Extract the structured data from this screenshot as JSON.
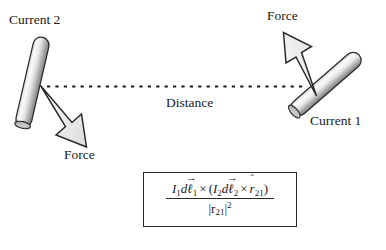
{
  "figure": {
    "type": "physics-force-diagram",
    "title_visible": false,
    "background_color": "#ffffff",
    "ink_color": "#1a1a1a"
  },
  "labels": {
    "current_2": "Current 2",
    "current_1": "Current 1",
    "distance": "Distance",
    "force_left": "Force",
    "force_right": "Force"
  },
  "elements": {
    "rod_left": {
      "name": "Current 2",
      "description": "shaded cylindrical current-carrying rod, tilted",
      "fill_light": "#f2f2f2",
      "fill_dark": "#8e8e8e"
    },
    "rod_right": {
      "name": "Current 1",
      "description": "shaded cylindrical current-carrying rod, tilted",
      "fill_light": "#f5f5f5",
      "fill_dark": "#8a8a8a"
    },
    "distance_line": {
      "style": "dashed",
      "color": "#1a1a1a"
    },
    "arrow_left": {
      "label": "Force",
      "direction": "down-right",
      "fill": "#eaeaea"
    },
    "arrow_right": {
      "label": "Force",
      "direction": "up-left",
      "fill": "#f0f0f0"
    }
  },
  "formula": {
    "numerator": {
      "term1_current": "I",
      "term1_current_sub": "1",
      "term1_d": "d",
      "term1_length": "ℓ",
      "term1_length_sub": "1",
      "cross1": "×",
      "open_paren": "(",
      "term2_current": "I",
      "term2_current_sub": "2",
      "term2_d": "d",
      "term2_length": "ℓ",
      "term2_length_sub": "2",
      "cross2": "×",
      "unit_vector": "r",
      "unit_vector_sub": "21",
      "close_paren": ")",
      "plain": "I1dℓ⃗1 × (I2dℓ⃗2 × r̂21)"
    },
    "denominator": {
      "bar_left": "|",
      "symbol": "r",
      "symbol_sub": "21",
      "bar_right": "|",
      "exponent": "2",
      "plain": "|r21|²"
    },
    "vector_arrow_glyph": "→",
    "hat_glyph": "ˆ"
  }
}
